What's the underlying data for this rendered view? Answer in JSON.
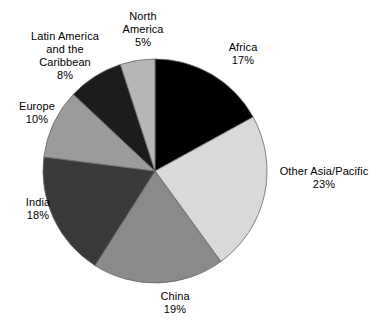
{
  "chart_data": {
    "type": "pie",
    "title": "",
    "xlabel": "",
    "ylabel": "",
    "legend_position": "none",
    "grid": false,
    "value_suffix": "%",
    "start_angle_deg": 0,
    "direction": "clockwise",
    "categories": [
      "Africa",
      "Other Asia/Pacific",
      "China",
      "India",
      "Europe",
      "Latin America and the Caribbean",
      "North America"
    ],
    "values": [
      17,
      23,
      19,
      18,
      10,
      8,
      5
    ],
    "slices": [
      {
        "id": "africa",
        "label": "Africa",
        "value": 17,
        "value_text": "17%",
        "color": "#000000",
        "label_lines": [
          "Africa"
        ]
      },
      {
        "id": "other-asia-pacific",
        "label": "Other Asia/Pacific",
        "value": 23,
        "value_text": "23%",
        "color": "#d9d9d9",
        "label_lines": [
          "Other Asia/Pacific"
        ]
      },
      {
        "id": "china",
        "label": "China",
        "value": 19,
        "value_text": "19%",
        "color": "#8a8a8a",
        "label_lines": [
          "China"
        ]
      },
      {
        "id": "india",
        "label": "India",
        "value": 18,
        "value_text": "18%",
        "color": "#3a3a3a",
        "label_lines": [
          "India"
        ]
      },
      {
        "id": "europe",
        "label": "Europe",
        "value": 10,
        "value_text": "10%",
        "color": "#9b9b9b",
        "label_lines": [
          "Europe"
        ]
      },
      {
        "id": "latin-america",
        "label": "Latin America and the Caribbean",
        "value": 8,
        "value_text": "8%",
        "color": "#1c1c1c",
        "label_lines": [
          "Latin America",
          "and the",
          "Caribbean"
        ]
      },
      {
        "id": "north-america",
        "label": "North America",
        "value": 5,
        "value_text": "5%",
        "color": "#b6b6b6",
        "label_lines": [
          "North",
          "America"
        ]
      }
    ],
    "geometry": {
      "center_x": 155,
      "center_y": 171,
      "radius": 112,
      "stroke_color": "#666666",
      "stroke_width": 0.8
    }
  },
  "labels": {
    "africa": {
      "name": "Africa",
      "value": "17%"
    },
    "other_asia_pacific": {
      "name": "Other Asia/Pacific",
      "value": "23%"
    },
    "china": {
      "name": "China",
      "value": "19%"
    },
    "india": {
      "name": "India",
      "value": "18%"
    },
    "europe": {
      "name": "Europe",
      "value": "10%"
    },
    "latin_america": {
      "line1": "Latin America",
      "line2": "and the",
      "line3": "Caribbean",
      "value": "8%"
    },
    "north_america": {
      "line1": "North",
      "line2": "America",
      "value": "5%"
    }
  }
}
